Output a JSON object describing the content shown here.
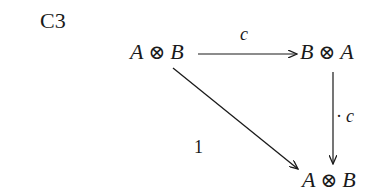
{
  "diagram": {
    "title": "C3",
    "nodes": [
      {
        "id": "top-left",
        "left": "A",
        "op": "⊗",
        "right": "B"
      },
      {
        "id": "top-right",
        "left": "B",
        "op": "⊗",
        "right": "A"
      },
      {
        "id": "bottom-right",
        "left": "A",
        "op": "⊗",
        "right": "B"
      }
    ],
    "arrows": [
      {
        "from": "top-left",
        "to": "top-right",
        "label": "c"
      },
      {
        "from": "top-right",
        "to": "bottom-right",
        "label_prefix": "·",
        "label": "c"
      },
      {
        "from": "top-left",
        "to": "bottom-right",
        "label": "1"
      }
    ]
  }
}
